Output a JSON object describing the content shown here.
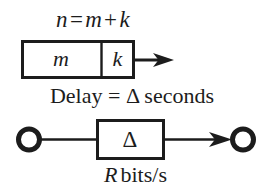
{
  "figure": {
    "width": 271,
    "height": 194,
    "background_color": "#ffffff",
    "ink_color": "#1c1c1c"
  },
  "equation_top": {
    "full_text": "n = m + k",
    "lhs": "n",
    "equals": "=",
    "term1": "m",
    "plus": "+",
    "term2": "k"
  },
  "packet": {
    "payload_label": "m",
    "header_label": "k",
    "arrow_name": "transmission-arrow"
  },
  "delay_caption": {
    "prefix": "Delay",
    "equals": "=",
    "symbol": "Δ",
    "suffix": "seconds",
    "full_text": "Delay = Δ seconds"
  },
  "link": {
    "box_label": "Δ",
    "source_node": "o",
    "destination_node": "o",
    "arrow_name": "link-arrow"
  },
  "rate_caption": {
    "symbol": "R",
    "unit": "bits/s",
    "full_text": "R bits/s"
  }
}
